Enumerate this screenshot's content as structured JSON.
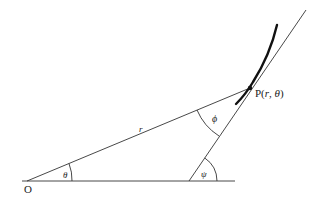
{
  "diagram": {
    "labels": {
      "origin": "O",
      "point_prefix": "P(",
      "point_r": "r",
      "point_sep": ", ",
      "point_theta": "θ",
      "point_suffix": ")",
      "radius": "r",
      "angle_theta": "θ",
      "angle_phi": "ϕ",
      "angle_psi": "ψ"
    },
    "colors": {
      "line": "#333333",
      "curve": "#111111",
      "text": "#222222",
      "background": "#ffffff"
    }
  }
}
